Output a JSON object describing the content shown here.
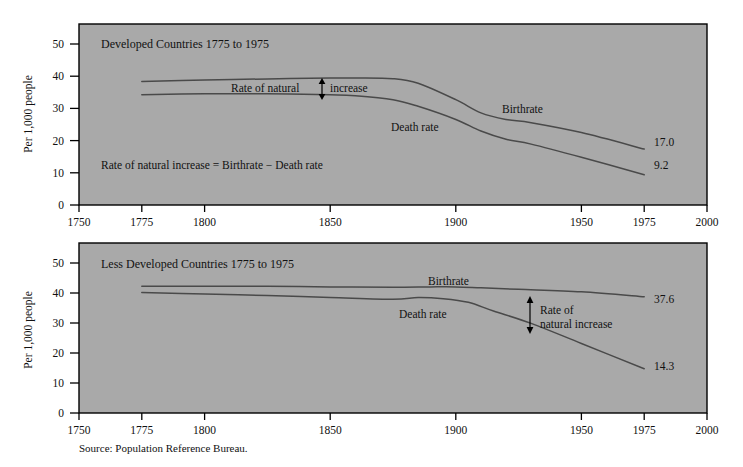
{
  "figure": {
    "source_note": "Source: Population Reference Bureau.",
    "plot_background_color": "#a9a9a9",
    "curve_color": "#4a4a4a",
    "axis_color": "#000000"
  },
  "chart_data": [
    {
      "type": "line",
      "title": "Developed Countries 1775 to 1975",
      "xlabel": "",
      "ylabel": "Per 1,000 people",
      "xlim": [
        1750,
        2000
      ],
      "ylim": [
        0,
        55
      ],
      "xticks": [
        1750,
        1775,
        1800,
        1850,
        1900,
        1950,
        1975,
        2000
      ],
      "xticklabels": [
        "1750",
        "1775",
        "1800",
        "1850",
        "1900",
        "1950",
        "1975",
        "2000"
      ],
      "yticks": [
        0,
        10,
        20,
        30,
        40,
        50
      ],
      "yticklabels": [
        "0",
        "10",
        "20",
        "30",
        "40",
        "50"
      ],
      "grid": false,
      "legend": "inline-labels",
      "series": [
        {
          "name": "Birthrate",
          "label_text": "Birthrate",
          "end_value_label": "17.0",
          "x": [
            1775,
            1800,
            1825,
            1850,
            1860,
            1875,
            1885,
            1900,
            1910,
            1920,
            1930,
            1950,
            1975
          ],
          "values": [
            37.5,
            38.0,
            38.3,
            38.6,
            38.6,
            38.4,
            37.0,
            32.0,
            28.0,
            26.0,
            25.0,
            22.0,
            17.0
          ]
        },
        {
          "name": "Death rate",
          "label_text": "Death rate",
          "end_value_label": "9.2",
          "x": [
            1775,
            1800,
            1825,
            1850,
            1860,
            1875,
            1885,
            1900,
            1910,
            1920,
            1930,
            1950,
            1975
          ],
          "values": [
            33.5,
            33.8,
            33.8,
            33.5,
            33.2,
            32.0,
            30.0,
            26.0,
            22.5,
            20.0,
            18.5,
            14.5,
            9.2
          ]
        }
      ],
      "annotations": [
        {
          "name": "rate-of-natural-increase-callout",
          "text_before": "Rate of natural",
          "text_after": "increase",
          "arrow": "double-vertical",
          "at_year": 1843
        },
        {
          "name": "formula-note",
          "text": "Rate of natural increase = Birthrate − Death rate"
        }
      ]
    },
    {
      "type": "line",
      "title": "Less Developed Countries 1775 to 1975",
      "xlabel": "",
      "ylabel": "Per 1,000 people",
      "xlim": [
        1750,
        2000
      ],
      "ylim": [
        0,
        55
      ],
      "xticks": [
        1750,
        1775,
        1800,
        1850,
        1900,
        1950,
        1975,
        2000
      ],
      "xticklabels": [
        "1750",
        "1775",
        "1800",
        "1850",
        "1900",
        "1950",
        "1975",
        "2000"
      ],
      "yticks": [
        0,
        10,
        20,
        30,
        40,
        50
      ],
      "yticklabels": [
        "0",
        "10",
        "20",
        "30",
        "40",
        "50"
      ],
      "grid": false,
      "legend": "inline-labels",
      "series": [
        {
          "name": "Birthrate",
          "label_text": "Birthrate",
          "end_value_label": "37.6",
          "x": [
            1775,
            1800,
            1825,
            1850,
            1875,
            1890,
            1900,
            1910,
            1925,
            1950,
            1975
          ],
          "values": [
            41.0,
            41.0,
            41.0,
            40.8,
            40.7,
            40.8,
            40.8,
            40.5,
            40.0,
            39.2,
            37.6
          ]
        },
        {
          "name": "Death rate",
          "label_text": "Death rate",
          "end_value_label": "14.3",
          "x": [
            1775,
            1800,
            1825,
            1850,
            1875,
            1885,
            1895,
            1905,
            1915,
            1930,
            1950,
            1975
          ],
          "values": [
            39.0,
            38.5,
            38.0,
            37.4,
            36.8,
            37.4,
            37.0,
            35.8,
            33.0,
            29.0,
            22.5,
            14.3
          ]
        }
      ],
      "annotations": [
        {
          "name": "rate-of-natural-increase-callout",
          "text_line1": "Rate of",
          "text_line2": "natural increase",
          "arrow": "double-vertical",
          "at_year": 1930
        }
      ]
    }
  ]
}
